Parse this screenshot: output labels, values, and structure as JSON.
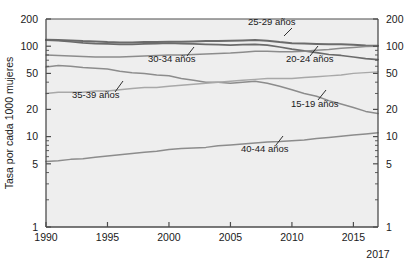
{
  "axes": {
    "ylabel": "Tasa por cada 1000 mujeres",
    "y_ticks_left": [
      "200",
      "100",
      "50",
      "20",
      "10",
      "5",
      "1"
    ],
    "y_ticks_right": [
      "200",
      "100",
      "50",
      "20",
      "10",
      "5",
      "1"
    ],
    "x_ticks": [
      "1990",
      "1995",
      "2000",
      "2005",
      "2010",
      "2015"
    ],
    "x_end_label": "2017"
  },
  "labels": {
    "l25_29": "25-29 años",
    "l30_34": "30-34 años",
    "l20_24": "20-24 años",
    "l35_39": "35-39 años",
    "l15_19": "15-19 años",
    "l40_44": "40-44 años"
  },
  "colors": {
    "plot_background": "#eeeeee",
    "axis": "#4d4d4d",
    "line_dark": "#6b6b6b",
    "line_mid": "#8c8c8c",
    "line_light": "#a8a8a8",
    "text": "#1a1a1a",
    "page_background": "#ffffff"
  },
  "chart_data": {
    "type": "line",
    "title": "",
    "xlabel": "",
    "ylabel": "Tasa por cada 1000 mujeres",
    "yscale": "log",
    "ylim": [
      1,
      200
    ],
    "xlim": [
      1990,
      2017
    ],
    "grid": false,
    "legend": "inline-annotations",
    "x": [
      1990,
      1991,
      1992,
      1993,
      1994,
      1995,
      1996,
      1997,
      1998,
      1999,
      2000,
      2001,
      2002,
      2003,
      2004,
      2005,
      2006,
      2007,
      2008,
      2009,
      2010,
      2011,
      2012,
      2013,
      2014,
      2015,
      2016,
      2017
    ],
    "series": [
      {
        "name": "25-29 años",
        "values": [
          118,
          117,
          116,
          114,
          113,
          111,
          110,
          110,
          111,
          111,
          112,
          112,
          113,
          114,
          114,
          115,
          116,
          117,
          115,
          111,
          108,
          107,
          106,
          105,
          105,
          104,
          102,
          101
        ]
      },
      {
        "name": "20-24 años",
        "values": [
          117,
          115,
          112,
          109,
          107,
          106,
          105,
          105,
          106,
          107,
          108,
          107,
          106,
          105,
          104,
          103,
          104,
          105,
          103,
          98,
          93,
          89,
          85,
          81,
          79,
          76,
          73,
          71
        ]
      },
      {
        "name": "30-34 años",
        "values": [
          80,
          79,
          78,
          77,
          76,
          76,
          76,
          77,
          78,
          79,
          80,
          80,
          81,
          82,
          83,
          84,
          86,
          88,
          88,
          87,
          87,
          88,
          90,
          92,
          95,
          97,
          99,
          100
        ]
      },
      {
        "name": "15-19 años",
        "values": [
          59,
          61,
          60,
          58,
          57,
          56,
          53,
          51,
          50,
          48,
          47,
          44,
          42,
          40,
          40,
          39,
          40,
          41,
          39,
          36,
          33,
          30,
          28,
          25,
          23,
          21,
          19,
          18
        ]
      },
      {
        "name": "35-39 años",
        "values": [
          30,
          31,
          31,
          31,
          32,
          32,
          33,
          34,
          35,
          35,
          36,
          37,
          38,
          39,
          40,
          41,
          42,
          43,
          44,
          44,
          44,
          45,
          46,
          47,
          48,
          50,
          51,
          52
        ]
      },
      {
        "name": "40-44 años",
        "values": [
          5.3,
          5.4,
          5.6,
          5.7,
          5.9,
          6.1,
          6.3,
          6.5,
          6.7,
          6.9,
          7.2,
          7.4,
          7.5,
          7.6,
          7.9,
          8.1,
          8.3,
          8.5,
          8.7,
          8.8,
          9.0,
          9.2,
          9.5,
          9.8,
          10.1,
          10.4,
          10.7,
          11.0
        ]
      }
    ]
  }
}
